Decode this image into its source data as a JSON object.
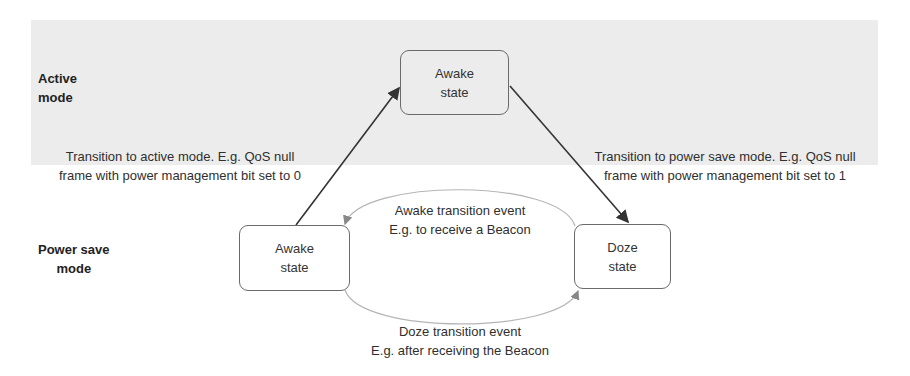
{
  "diagram": {
    "type": "state-transition",
    "band_color": "#ececec",
    "modes": {
      "active": {
        "line1": "Active",
        "line2": "mode"
      },
      "power_save": {
        "line1": "Power save",
        "line2": "mode"
      }
    },
    "states": {
      "active_awake": {
        "line1": "Awake",
        "line2": "state"
      },
      "ps_awake": {
        "line1": "Awake",
        "line2": "state"
      },
      "ps_doze": {
        "line1": "Doze",
        "line2": "state"
      }
    },
    "transitions": {
      "to_active": {
        "line1": "Transition to active mode. E.g. QoS null",
        "line2": "frame with power management bit set to 0"
      },
      "to_power_save": {
        "line1": "Transition to power save mode. E.g. QoS null",
        "line2": "frame with power management bit set to 1"
      },
      "awake_event": {
        "line1": "Awake transition event",
        "line2": "E.g. to receive a Beacon"
      },
      "doze_event": {
        "line1": "Doze transition event",
        "line2": "E.g. after receiving the Beacon"
      }
    }
  }
}
